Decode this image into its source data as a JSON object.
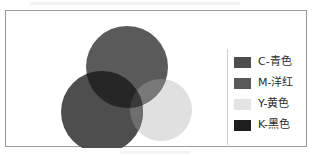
{
  "figure": {
    "title": "",
    "border_color": "#9a9a9a",
    "background_color": "#ffffff"
  },
  "legend": {
    "divider_color": "#cfcfcf",
    "items": [
      {
        "key": "C",
        "label": "C-青色",
        "swatch_color": "#4e4e4e",
        "swatch_name": "cyan-swatch"
      },
      {
        "key": "M",
        "label": "M-洋红",
        "swatch_color": "#5a5a5a",
        "swatch_name": "magenta-swatch"
      },
      {
        "key": "Y",
        "label": "Y-黄色",
        "swatch_color": "#e4e4e4",
        "swatch_name": "yellow-swatch"
      },
      {
        "key": "K",
        "label": "K-黑色",
        "swatch_color": "#1e1e1e",
        "swatch_name": "black-swatch"
      }
    ]
  },
  "chart_data": {
    "type": "venn",
    "title": "",
    "subtitle": "",
    "xlabel": "",
    "ylabel": "",
    "grid": false,
    "legend_position": "right",
    "note": "CMYK subtractive color model shown as three overlapping circles rendered in grayscale",
    "sets": [
      {
        "name": "C-青色",
        "key": "C",
        "color": "#4e4e4e",
        "cx": 96,
        "cy": 101,
        "r": 41,
        "position": "lower-left"
      },
      {
        "name": "M-洋红",
        "key": "M",
        "color": "#5a5a5a",
        "cx": 121,
        "cy": 56,
        "r": 41,
        "position": "top"
      },
      {
        "name": "Y-黄色",
        "key": "Y",
        "color": "#e0e0e0",
        "cx": 155,
        "cy": 99,
        "r": 31,
        "position": "lower-right"
      }
    ],
    "intersections": [
      {
        "sets": [
          "C",
          "M"
        ],
        "name": "K-黑色",
        "color": "#262626"
      },
      {
        "sets": [
          "C",
          "Y"
        ],
        "name": "",
        "color": "#6e6e6e"
      },
      {
        "sets": [
          "M",
          "Y"
        ],
        "name": "",
        "color": "#787878"
      },
      {
        "sets": [
          "C",
          "M",
          "Y"
        ],
        "name": "K-黑色",
        "color": "#3a3a3a"
      }
    ]
  }
}
